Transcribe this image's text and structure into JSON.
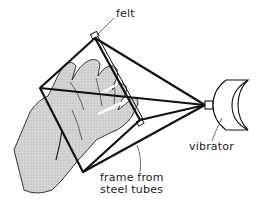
{
  "figure": {
    "labels": {
      "felt": "felt",
      "vibrator": "vibrator",
      "frame_line1": "frame from",
      "frame_line2": "steel tubes"
    },
    "colors": {
      "line": "#111111",
      "hand_fill": "#cfcfcf",
      "hand_stipple": "#b8b8b8",
      "background": "#ffffff"
    }
  }
}
